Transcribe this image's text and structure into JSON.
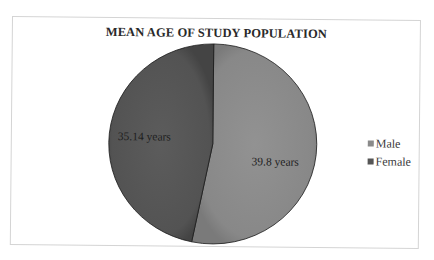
{
  "chart_data": {
    "type": "pie",
    "title": "MEAN AGE OF STUDY POPULATION",
    "categories": [
      "Male",
      "Female"
    ],
    "values": [
      39.8,
      35.14
    ],
    "unit": "years",
    "data_labels": [
      "39.8 years",
      "35.14 years"
    ],
    "colors": [
      "#8a8a8a",
      "#555555"
    ],
    "start_angle_deg": 0,
    "direction": "clockwise",
    "legend": {
      "position": "right",
      "entries": [
        "Male",
        "Female"
      ]
    }
  },
  "chart": {
    "title": "MEAN AGE OF STUDY POPULATION",
    "slices": [
      {
        "name": "Male",
        "value": 39.8,
        "label": "39.8 years",
        "color": "#8a8a8a"
      },
      {
        "name": "Female",
        "value": 35.14,
        "label": "35.14 years",
        "color": "#555555"
      }
    ],
    "legend": [
      {
        "label": "Male",
        "color": "#8a8a8a"
      },
      {
        "label": "Female",
        "color": "#555555"
      }
    ]
  }
}
